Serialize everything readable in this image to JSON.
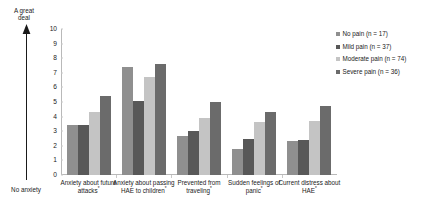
{
  "axis": {
    "top_anchor": "A great\ndeal",
    "bottom_anchor": "No anxiety",
    "y_ticks": [
      "10",
      "9",
      "8",
      "7",
      "6",
      "5",
      "4",
      "3",
      "2",
      "1",
      "0"
    ]
  },
  "legend": {
    "items": [
      {
        "label": "No pain (n = 17)",
        "color": "#8f8f8f",
        "icon": "legend-swatch-icon"
      },
      {
        "label": "Mild pain (n = 37)",
        "color": "#585858",
        "icon": "legend-swatch-icon"
      },
      {
        "label": "Moderate pain (n = 74)",
        "color": "#c4c4c4",
        "icon": "legend-swatch-icon"
      },
      {
        "label": "Severe pain (n = 36)",
        "color": "#6b6b6b",
        "icon": "legend-swatch-icon"
      }
    ]
  },
  "chart_data": {
    "type": "bar",
    "title": "",
    "xlabel": "",
    "ylabel": "",
    "ylim": [
      0,
      10
    ],
    "grid": false,
    "legend_position": "right",
    "categories": [
      "Anxiety about future attacks*",
      "Anxiety about passing HAE to children*",
      "Prevented from traveling*",
      "Sudden feelings of panic*",
      "Current distress about HAE*"
    ],
    "category_lines": [
      [
        "Anxiety about future",
        "attacks*"
      ],
      [
        "Anxiety about passing",
        "HAE to children*"
      ],
      [
        "Prevented from",
        "traveling*"
      ],
      [
        "Sudden feelings of",
        "panic*"
      ],
      [
        "Current distress about",
        "HAE*"
      ]
    ],
    "series": [
      {
        "name": "No pain (n = 17)",
        "color": "#8f8f8f",
        "values": [
          3.4,
          7.4,
          2.7,
          1.8,
          2.3
        ]
      },
      {
        "name": "Mild pain (n = 37)",
        "color": "#585858",
        "values": [
          3.4,
          5.1,
          3.0,
          2.5,
          2.4
        ]
      },
      {
        "name": "Moderate pain (n = 74)",
        "color": "#c4c4c4",
        "values": [
          4.3,
          6.7,
          3.9,
          3.6,
          3.7
        ]
      },
      {
        "name": "Severe pain (n = 36)",
        "color": "#6b6b6b",
        "values": [
          5.4,
          7.6,
          5.0,
          4.3,
          4.7
        ]
      }
    ]
  }
}
